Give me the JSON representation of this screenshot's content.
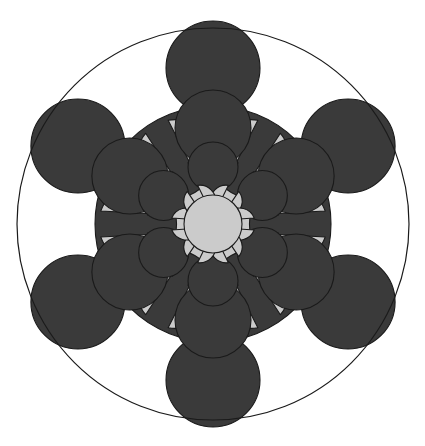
{
  "figure": {
    "type": "diagram",
    "width": 425,
    "height": 446,
    "background_color": "#ffffff",
    "symmetry_order": 6,
    "symmetry_start_angle_deg": -90,
    "center": {
      "x": 213,
      "y": 224
    },
    "colors": {
      "light": "#cbcbcb",
      "dark": "#3a3a3a",
      "outline": "#1a1a1a",
      "background": "#ffffff"
    },
    "stroke_width": 1.1,
    "outer_circle": {
      "name": "bounding-circle",
      "cx": 213,
      "cy": 224,
      "r": 196,
      "fill": "none",
      "stroke": "#1a1a1a",
      "stroke_width": 1.2
    },
    "base_blob": {
      "name": "dark-core-blob",
      "cx": 213,
      "cy": 224,
      "r": 118,
      "fill": "#3a3a3a"
    },
    "rings": [
      {
        "name": "ring-outer-dark",
        "kind": "dark-circle",
        "radius_from_center": 156,
        "circle_radius": 47,
        "fill": "#3a3a3a",
        "angles_deg": [
          -90,
          -30,
          30,
          90,
          150,
          210
        ]
      },
      {
        "name": "ring-outer-light",
        "kind": "light-balloon",
        "radius_from_center": 149,
        "circle_radius": 39,
        "stem_half_width": 13,
        "fill": "#cbcbcb",
        "angles_deg": [
          -60,
          0,
          60,
          120,
          180,
          240
        ]
      },
      {
        "name": "ring-mid-dark",
        "kind": "dark-circle",
        "radius_from_center": 96,
        "circle_radius": 38,
        "fill": "#3a3a3a",
        "angles_deg": [
          -90,
          -30,
          30,
          90,
          150,
          210
        ]
      },
      {
        "name": "ring-mid-light",
        "kind": "light-balloon",
        "radius_from_center": 92,
        "circle_radius": 28,
        "stem_half_width": 9,
        "fill": "#cbcbcb",
        "angles_deg": [
          -60,
          0,
          60,
          120,
          180,
          240
        ]
      },
      {
        "name": "ring-inner-dark",
        "kind": "dark-circle",
        "radius_from_center": 57,
        "circle_radius": 25,
        "fill": "#3a3a3a",
        "angles_deg": [
          -90,
          -30,
          30,
          90,
          150,
          210
        ]
      },
      {
        "name": "ring-inner-light",
        "kind": "light-balloon",
        "radius_from_center": 56,
        "circle_radius": 16,
        "stem_half_width": 6,
        "fill": "#cbcbcb",
        "angles_deg": [
          -60,
          0,
          60,
          120,
          180,
          240
        ]
      }
    ],
    "center_disc": {
      "name": "center-light-disc",
      "cx": 213,
      "cy": 224,
      "r": 29,
      "fill": "#cbcbcb"
    }
  }
}
